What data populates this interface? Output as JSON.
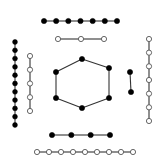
{
  "diagram": {
    "colors": {
      "filled_node": "#000000",
      "open_node_fill": "#ffffff",
      "edge": "#333333"
    },
    "components": [
      {
        "id": "path-top-filled",
        "kind": "path",
        "style": "filled",
        "node_count": 7,
        "orientation": "horizontal"
      },
      {
        "id": "path-top-open",
        "kind": "path",
        "style": "open",
        "node_count": 3,
        "orientation": "horizontal"
      },
      {
        "id": "path-left-filled",
        "kind": "path",
        "style": "filled",
        "node_count": 11,
        "orientation": "vertical"
      },
      {
        "id": "path-left-open",
        "kind": "path",
        "style": "open",
        "node_count": 5,
        "orientation": "vertical"
      },
      {
        "id": "cycle-center",
        "kind": "cycle",
        "style": "filled",
        "node_count": 6
      },
      {
        "id": "edge-right-filled",
        "kind": "path",
        "style": "filled",
        "node_count": 2,
        "orientation": "vertical"
      },
      {
        "id": "path-right-open",
        "kind": "path",
        "style": "open",
        "node_count": 7,
        "orientation": "vertical"
      },
      {
        "id": "path-bottom-filled",
        "kind": "path",
        "style": "filled",
        "node_count": 4,
        "orientation": "horizontal"
      },
      {
        "id": "path-bottom-open",
        "kind": "path",
        "style": "open",
        "node_count": 9,
        "orientation": "horizontal"
      }
    ]
  }
}
